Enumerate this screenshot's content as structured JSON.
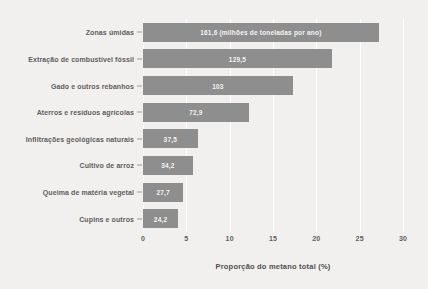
{
  "chart_data": {
    "type": "bar",
    "orientation": "horizontal",
    "title": "",
    "xlabel": "Proporção do metano total (%)",
    "ylabel": "",
    "xlim": [
      0,
      30
    ],
    "xticks": [
      "0",
      "5",
      "10",
      "15",
      "20",
      "25",
      "30"
    ],
    "xtick_values": [
      0,
      5,
      10,
      15,
      20,
      25,
      30
    ],
    "grid": true,
    "legend": "none",
    "value_unit_note": "milhões de toneladas por ano",
    "categories": [
      "Zonas úmidas",
      "Extração de combustível fóssil",
      "Gado e outros rebanhos",
      "Aterros e resíduos agrícolas",
      "Infiltrações geológicas naturais",
      "Cultivo de arroz",
      "Queima de matéria vegetal",
      "Cupins e outros"
    ],
    "values": [
      27.2,
      21.8,
      17.3,
      12.2,
      6.3,
      5.75,
      4.65,
      4.05
    ],
    "data_labels": [
      "161,6 (milhões de toneladas por ano)",
      "129,5",
      "103",
      "72,9",
      "37,5",
      "34,2",
      "27,7",
      "24,2"
    ],
    "absolute_values_mt_per_year": [
      161.6,
      129.5,
      103,
      72.9,
      37.5,
      34.2,
      27.7,
      24.2
    ],
    "colors": {
      "bar": "#8e8e8e",
      "background": "#f2f0ee",
      "gridline": "#ffffff",
      "label_text": "#5d5d5d",
      "bar_label_text": "#f4f4f4"
    }
  },
  "ghost_text": {
    "lines": [
      "",
      "",
      ""
    ]
  }
}
